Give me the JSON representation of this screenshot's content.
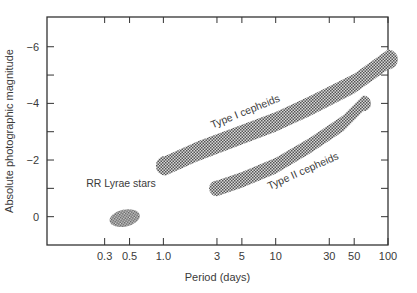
{
  "chart_data": {
    "type": "scatter",
    "title": "",
    "xlabel": "Period (days)",
    "ylabel": "Absolute photographic magnitude",
    "xscale": "log",
    "xlim": [
      0.092,
      100
    ],
    "ylim": [
      1.0,
      -7.05
    ],
    "y_inverted": true,
    "grid": false,
    "legend": "none",
    "x_ticks": [
      {
        "value": 0.3,
        "label": "0.3"
      },
      {
        "value": 0.5,
        "label": "0.5"
      },
      {
        "value": 1.0,
        "label": "1.0"
      },
      {
        "value": 3,
        "label": "3"
      },
      {
        "value": 5,
        "label": "5"
      },
      {
        "value": 10,
        "label": "10"
      },
      {
        "value": 30,
        "label": "30"
      },
      {
        "value": 50,
        "label": "50"
      },
      {
        "value": 100,
        "label": "100"
      }
    ],
    "y_major_ticks": [
      {
        "value": -6,
        "label": "−6"
      },
      {
        "value": -4,
        "label": "−4"
      },
      {
        "value": -2,
        "label": "−2"
      },
      {
        "value": 0,
        "label": "0"
      }
    ],
    "y_minor_ticks": [
      -5,
      -3,
      -1
    ],
    "series": [
      {
        "name": "Type I cepheids",
        "kind": "band",
        "fill": "#6e6e6e",
        "centerline": [
          {
            "period": 1.05,
            "magnitude": -1.8
          },
          {
            "period": 2,
            "magnitude": -2.3
          },
          {
            "period": 5,
            "magnitude": -2.9
          },
          {
            "period": 10,
            "magnitude": -3.35
          },
          {
            "period": 20,
            "magnitude": -3.9
          },
          {
            "period": 50,
            "magnitude": -4.7
          },
          {
            "period": 100,
            "magnitude": -5.55
          }
        ],
        "half_width_mag": 0.35
      },
      {
        "name": "Type II cepheids",
        "kind": "band",
        "fill": "#6e6e6e",
        "centerline": [
          {
            "period": 3,
            "magnitude": -1.0
          },
          {
            "period": 5,
            "magnitude": -1.3
          },
          {
            "period": 10,
            "magnitude": -1.8
          },
          {
            "period": 20,
            "magnitude": -2.5
          },
          {
            "period": 40,
            "magnitude": -3.3
          },
          {
            "period": 60,
            "magnitude": -4.0
          }
        ],
        "half_width_mag": 0.28
      },
      {
        "name": "RR Lyrae stars",
        "kind": "ellipse",
        "fill": "#6e6e6e",
        "center": {
          "period": 0.44,
          "magnitude": 0.05
        },
        "period_range": [
          0.33,
          0.62
        ],
        "magnitude_range": [
          -0.25,
          0.35
        ]
      }
    ],
    "annotations": [
      {
        "text": "Type I cepheids",
        "near_period": 5.5,
        "near_magnitude": -3.6
      },
      {
        "text": "Type II cepheids",
        "near_period": 18,
        "near_magnitude": -1.5
      },
      {
        "text": "RR Lyrae stars",
        "near_period": 0.42,
        "near_magnitude": -1.05
      }
    ]
  }
}
